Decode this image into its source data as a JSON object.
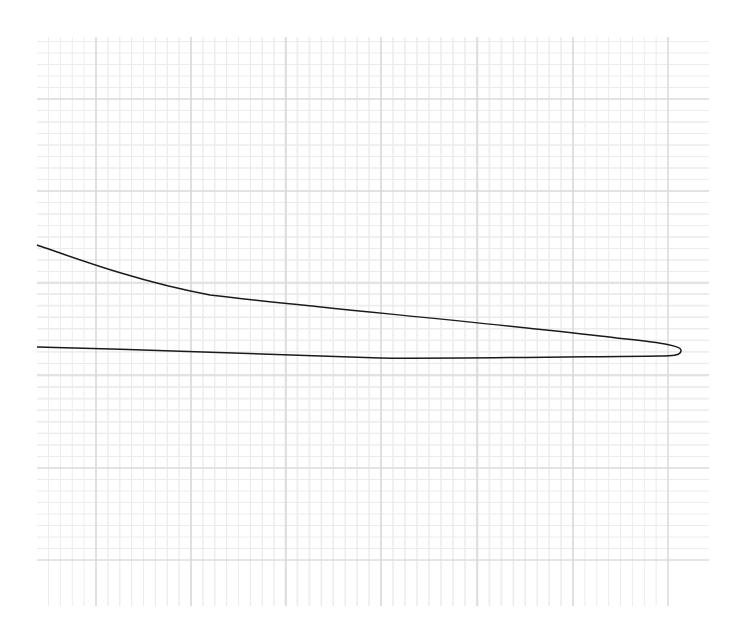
{
  "diagram": {
    "type": "airfoil-profile-on-graph-paper",
    "grid": {
      "left": 37,
      "top": 37,
      "right": 709,
      "bottom": 606,
      "major_x": [
        96,
        191,
        286,
        381,
        477,
        573,
        668
      ],
      "major_y": [
        99,
        191,
        283,
        375,
        468,
        560
      ],
      "minor_step": 11.7,
      "major_color": "#d6d6d6",
      "minor_color": "#ececec"
    },
    "curve": {
      "stroke": "#1a1a1a",
      "stroke_width": 1.5,
      "path": "M37,245 C80,260 140,282 210,295 C300,306 480,322 600,336 C650,342 680,344 681,350 C682,356 670,356 660,356 C560,357 420,359 380,358 C300,356 160,350 37,347"
    }
  }
}
